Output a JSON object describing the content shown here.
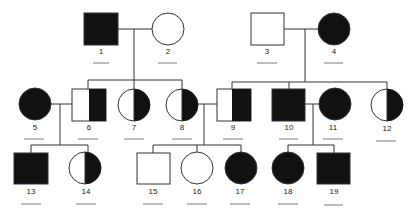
{
  "diagram": {
    "type": "pedigree",
    "colors": {
      "affected": "#111111",
      "stroke": "#333333",
      "background": "#ffffff"
    },
    "individuals": [
      {
        "id": "1",
        "label": "1",
        "sex": "male",
        "status": "affected",
        "generation": "I"
      },
      {
        "id": "2",
        "label": "2",
        "sex": "female",
        "status": "unaffected",
        "generation": "I"
      },
      {
        "id": "3",
        "label": "3",
        "sex": "male",
        "status": "unaffected",
        "generation": "I"
      },
      {
        "id": "4",
        "label": "4",
        "sex": "female",
        "status": "affected",
        "generation": "I"
      },
      {
        "id": "5",
        "label": "5",
        "sex": "female",
        "status": "affected",
        "generation": "II"
      },
      {
        "id": "6",
        "label": "6",
        "sex": "male",
        "status": "half",
        "generation": "II"
      },
      {
        "id": "7",
        "label": "7",
        "sex": "female",
        "status": "half",
        "generation": "II"
      },
      {
        "id": "8",
        "label": "8",
        "sex": "female",
        "status": "half",
        "generation": "II"
      },
      {
        "id": "9",
        "label": "9",
        "sex": "male",
        "status": "half",
        "generation": "II"
      },
      {
        "id": "10",
        "label": "10",
        "sex": "male",
        "status": "affected",
        "generation": "II"
      },
      {
        "id": "11",
        "label": "11",
        "sex": "female",
        "status": "affected",
        "generation": "II"
      },
      {
        "id": "12",
        "label": "12",
        "sex": "female",
        "status": "half",
        "generation": "II"
      },
      {
        "id": "13",
        "label": "13",
        "sex": "male",
        "status": "affected",
        "generation": "III"
      },
      {
        "id": "14",
        "label": "14",
        "sex": "female",
        "status": "half",
        "generation": "III"
      },
      {
        "id": "15",
        "label": "15",
        "sex": "male",
        "status": "unaffected",
        "generation": "III"
      },
      {
        "id": "16",
        "label": "16",
        "sex": "female",
        "status": "unaffected",
        "generation": "III"
      },
      {
        "id": "17",
        "label": "17",
        "sex": "female",
        "status": "affected",
        "generation": "III"
      },
      {
        "id": "18",
        "label": "18",
        "sex": "female",
        "status": "affected",
        "generation": "III"
      },
      {
        "id": "19",
        "label": "19",
        "sex": "male",
        "status": "affected",
        "generation": "III"
      }
    ],
    "matings": [
      {
        "partners": [
          "1",
          "2"
        ],
        "children": [
          "6",
          "7",
          "8"
        ]
      },
      {
        "partners": [
          "3",
          "4"
        ],
        "children": [
          "9",
          "10",
          "12"
        ]
      },
      {
        "partners": [
          "5",
          "6"
        ],
        "children": [
          "13",
          "14"
        ]
      },
      {
        "partners": [
          "8",
          "9"
        ],
        "children": [
          "15",
          "16",
          "17"
        ]
      },
      {
        "partners": [
          "10",
          "11"
        ],
        "children": [
          "18",
          "19"
        ]
      }
    ],
    "answer_blanks": [
      "",
      "",
      "",
      "",
      "",
      "",
      "",
      "",
      "",
      "",
      "",
      "",
      "",
      "",
      "",
      "",
      "",
      "",
      ""
    ]
  }
}
